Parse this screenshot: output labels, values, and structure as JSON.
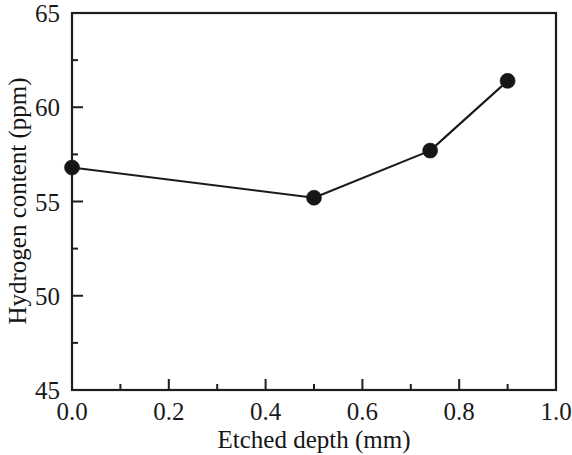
{
  "chart_data": {
    "type": "line",
    "title": "",
    "subtitle": "",
    "xlabel": "Etched depth (mm)",
    "ylabel": "Hydrogen content (ppm)",
    "xlim": [
      0.0,
      1.0
    ],
    "ylim": [
      45,
      65
    ],
    "xticks": [
      0.0,
      0.2,
      0.4,
      0.6,
      0.8,
      1.0
    ],
    "xtick_labels": [
      "0.0",
      "0.2",
      "0.4",
      "0.6",
      "0.8",
      "1.0"
    ],
    "xticks_minor": [
      0.1,
      0.3,
      0.5,
      0.7,
      0.9
    ],
    "yticks": [
      45,
      50,
      55,
      60,
      65
    ],
    "ytick_labels": [
      "45",
      "50",
      "55",
      "60",
      "65"
    ],
    "yticks_minor": [
      47.5,
      52.5,
      57.5,
      62.5
    ],
    "grid": false,
    "legend": false,
    "legend_position": "none",
    "marker": "filled-circle",
    "marker_color": "#161616",
    "line_color": "#1b1b1b",
    "axis_color": "#1d1d1d",
    "background_color": "#ffffff",
    "x": [
      0.0,
      0.5,
      0.74,
      0.9
    ],
    "y": [
      56.8,
      55.2,
      57.7,
      61.4
    ],
    "series": [
      {
        "name": "Hydrogen content",
        "points": [
          {
            "x": 0.0,
            "y": 56.8
          },
          {
            "x": 0.5,
            "y": 55.2
          },
          {
            "x": 0.74,
            "y": 57.7
          },
          {
            "x": 0.9,
            "y": 61.4
          }
        ]
      }
    ]
  }
}
